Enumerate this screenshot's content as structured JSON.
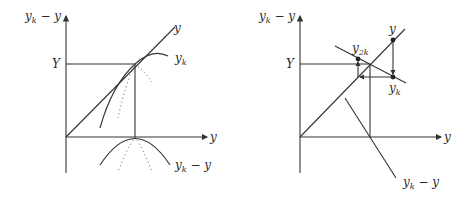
{
  "left_panel": {
    "y_axis_label": "y_k − y",
    "x_axis_label": "y",
    "level_label": "Y",
    "diagonal_label": "y",
    "curve_label": "y_k",
    "lower_curve_label": "y_k − y"
  },
  "right_panel": {
    "y_axis_label": "y_k − y",
    "x_axis_label": "y",
    "level_label": "Y",
    "diagonal_label": "y",
    "point_top_label": "y",
    "point_yk_label": "y_k",
    "point_y2k_label": "y_2k",
    "line_label": "y_k − y"
  }
}
